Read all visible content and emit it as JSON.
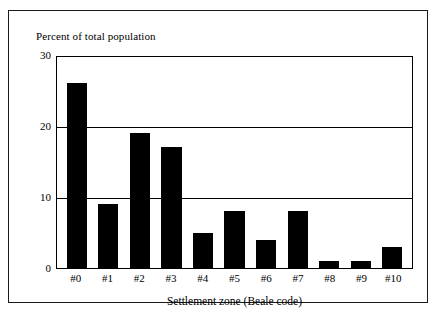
{
  "chart_data": {
    "type": "bar",
    "title": "",
    "categories": [
      "#0",
      "#1",
      "#2",
      "#3",
      "#4",
      "#5",
      "#6",
      "#7",
      "#8",
      "#9",
      "#10"
    ],
    "values": [
      26,
      9,
      19,
      17,
      5,
      8,
      4,
      8,
      1,
      1,
      3
    ],
    "xlabel": "Settlement zone (Beale code)",
    "ylabel": "Percent of total population",
    "ylim": [
      0,
      30
    ],
    "yticks": [
      0,
      10,
      20,
      30
    ],
    "ytick_labels": [
      "0",
      "10",
      "20",
      "30"
    ],
    "grid": "horizontal",
    "legend": "none",
    "bar_color": "#000000",
    "background_color": "#ffffff",
    "axis_color": "#000000"
  },
  "figure": {
    "y_axis_caption": "Percent of total population",
    "x_axis_caption": "Settlement zone (Beale code)",
    "border_color": "#1a1a1a"
  }
}
